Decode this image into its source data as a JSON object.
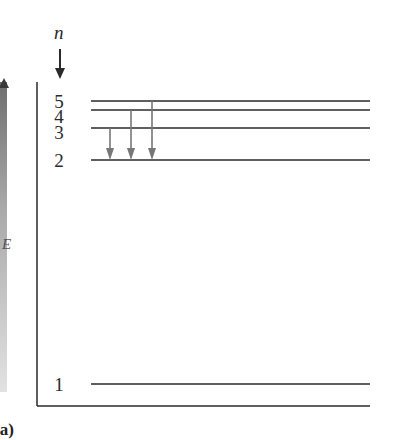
{
  "diagram": {
    "axis_symbol": "n",
    "side_axis_label": "E",
    "figure_label": "(a)",
    "colors": {
      "line": "#2a2a2a",
      "transition_arrow": "#777777",
      "side_gradient_top": "#6e6e6e",
      "side_gradient_bottom": "#e2e2e2"
    },
    "levels": [
      {
        "n": "5",
        "y": 101,
        "label_y": 92
      },
      {
        "n": "4",
        "y": 110,
        "label_y": 107
      },
      {
        "n": "3",
        "y": 128,
        "label_y": 123
      },
      {
        "n": "2",
        "y": 160,
        "label_y": 151
      },
      {
        "n": "1",
        "y": 384,
        "label_y": 375
      }
    ],
    "transitions": [
      {
        "from": "3",
        "to": "2",
        "x": 110
      },
      {
        "from": "4",
        "to": "2",
        "x": 131
      },
      {
        "from": "5",
        "to": "2",
        "x": 152
      }
    ],
    "level_line": {
      "x_start": 91,
      "x_end": 370
    },
    "frame": {
      "axis_x": 37,
      "axis_top": 82,
      "baseline_y": 406,
      "baseline_x_end": 370
    }
  }
}
